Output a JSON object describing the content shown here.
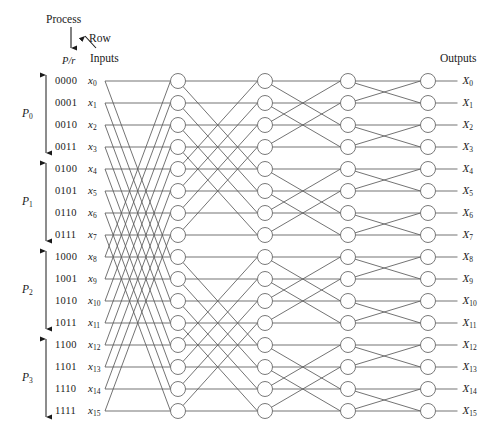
{
  "figure": {
    "caption_fragment": ""
  },
  "headers": {
    "process": "Process",
    "row": "Row",
    "pr": "P/r",
    "inputs": "Inputs",
    "outputs": "Outputs"
  },
  "process_groups": [
    {
      "label": "P",
      "sub": "0"
    },
    {
      "label": "P",
      "sub": "1"
    },
    {
      "label": "P",
      "sub": "2"
    },
    {
      "label": "P",
      "sub": "3"
    }
  ],
  "rows": [
    {
      "bits": "0000",
      "input": "x",
      "input_sub": "0",
      "output": "X",
      "output_sub": "0"
    },
    {
      "bits": "0001",
      "input": "x",
      "input_sub": "1",
      "output": "X",
      "output_sub": "1"
    },
    {
      "bits": "0010",
      "input": "x",
      "input_sub": "2",
      "output": "X",
      "output_sub": "2"
    },
    {
      "bits": "0011",
      "input": "x",
      "input_sub": "3",
      "output": "X",
      "output_sub": "3"
    },
    {
      "bits": "0100",
      "input": "x",
      "input_sub": "4",
      "output": "X",
      "output_sub": "4"
    },
    {
      "bits": "0101",
      "input": "x",
      "input_sub": "5",
      "output": "X",
      "output_sub": "5"
    },
    {
      "bits": "0110",
      "input": "x",
      "input_sub": "6",
      "output": "X",
      "output_sub": "6"
    },
    {
      "bits": "0111",
      "input": "x",
      "input_sub": "7",
      "output": "X",
      "output_sub": "7"
    },
    {
      "bits": "1000",
      "input": "x",
      "input_sub": "8",
      "output": "X",
      "output_sub": "8"
    },
    {
      "bits": "1001",
      "input": "x",
      "input_sub": "9",
      "output": "X",
      "output_sub": "9"
    },
    {
      "bits": "1010",
      "input": "x",
      "input_sub": "10",
      "output": "X",
      "output_sub": "10"
    },
    {
      "bits": "1011",
      "input": "x",
      "input_sub": "11",
      "output": "X",
      "output_sub": "11"
    },
    {
      "bits": "1100",
      "input": "x",
      "input_sub": "12",
      "output": "X",
      "output_sub": "12"
    },
    {
      "bits": "1101",
      "input": "x",
      "input_sub": "13",
      "output": "X",
      "output_sub": "13"
    },
    {
      "bits": "1110",
      "input": "x",
      "input_sub": "14",
      "output": "X",
      "output_sub": "14"
    },
    {
      "bits": "1111",
      "input": "x",
      "input_sub": "15",
      "output": "X",
      "output_sub": "15"
    }
  ],
  "chart_data": {
    "type": "diagram",
    "diagram_kind": "butterfly-multistage-interconnection-network",
    "n_rows": 16,
    "n_stages": 4,
    "stage_spans": [
      8,
      4,
      2,
      1
    ],
    "node_columns_x": [
      178,
      265,
      348,
      428
    ],
    "input_stub_x": 105,
    "row_start_y": 81,
    "row_spacing_y": 22,
    "node_radius": 7.5,
    "line_color": "#5a5a5a",
    "node_fill": "#ffffff",
    "node_stroke": "#6a6a6a",
    "text_color": "#1a1a1a"
  }
}
